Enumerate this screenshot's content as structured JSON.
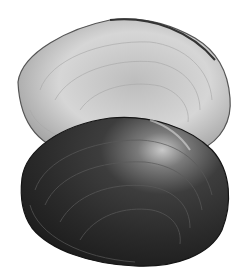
{
  "image": {
    "subject": "two freshwater mussel shells",
    "background": "#ffffff",
    "shells": [
      {
        "name": "light-shell-interior",
        "tone": "light gray",
        "fill": "#cfcfcf",
        "edge": "#4a4a4a"
      },
      {
        "name": "dark-shell-exterior",
        "tone": "dark gray",
        "fill": "#2e2e2e",
        "edge": "#1a1a1a"
      }
    ]
  }
}
